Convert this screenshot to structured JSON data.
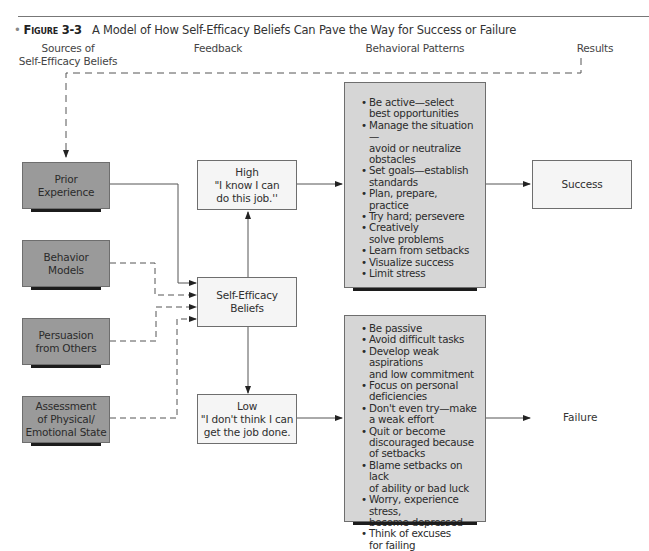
{
  "figure": {
    "number": "Figure 3-3",
    "title": "A Model of How Self-Efficacy Beliefs Can Pave the Way for Success or Failure"
  },
  "columns": {
    "sources": "Sources of\nSelf-Efficacy Beliefs",
    "feedback": "Feedback",
    "patterns": "Behavioral Patterns",
    "results": "Results"
  },
  "sources": [
    {
      "label": "Prior\nExperience",
      "link": "solid"
    },
    {
      "label": "Behavior\nModels",
      "link": "dashed"
    },
    {
      "label": "Persuasion\nfrom Others",
      "link": "dashed"
    },
    {
      "label": "Assessment\nof Physical/\nEmotional State",
      "link": "dashed"
    }
  ],
  "center": {
    "label": "Self-Efficacy\nBeliefs"
  },
  "high": {
    "level": "High",
    "quote": "\"I know I can\ndo this job.''"
  },
  "low": {
    "level": "Low",
    "quote": "\"I don't think I can\nget the job done."
  },
  "high_patterns": [
    "Be active—select\nbest opportunities",
    "Manage the situation—\navoid or neutralize\nobstacles",
    "Set  goals—establish\nstandards",
    "Plan, prepare, practice",
    "Try hard; persevere",
    "Creatively\nsolve problems",
    "Learn from setbacks",
    "Visualize success",
    "Limit stress"
  ],
  "low_patterns": [
    "Be passive",
    "Avoid difficult tasks",
    "Develop weak aspirations\nand low commitment",
    "Focus on personal\ndeficiencies",
    "Don't even try—make\na weak effort",
    "Quit or become\ndiscouraged because\nof setbacks",
    "Blame setbacks on lack\nof ability or bad luck",
    "Worry, experience stress,\nbecome depressed",
    "Think of excuses\nfor failing"
  ],
  "results": {
    "success": "Success",
    "failure": "Failure"
  },
  "colors": {
    "source_box": "#9a9a9a",
    "pattern_panel": "#d6d6d6",
    "light_box": "#f5f5f5",
    "line": "#555555",
    "shadow": "#1c1c1c"
  }
}
